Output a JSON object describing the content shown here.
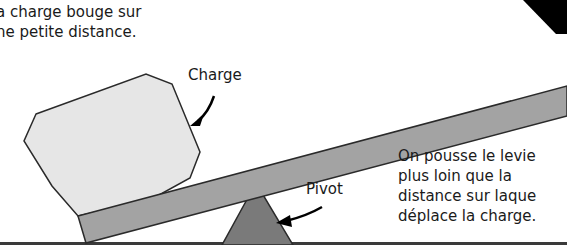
{
  "diagram": {
    "captions": {
      "load_motion": [
        "a charge bouge sur",
        "ne petite distance."
      ],
      "effort_motion": [
        "On pousse le levie",
        "plus loin que la",
        "distance sur laque",
        "déplace la charge."
      ]
    },
    "labels": {
      "load": "Charge",
      "pivot": "Pivot"
    },
    "colors": {
      "background": "#ffffff",
      "lever_fill": "#a3a3a3",
      "load_fill": "#e6e6e6",
      "pivot_fill": "#7a7a7a",
      "outline": "#2a2a2a",
      "effort_arrow": "#000000",
      "text": "#1a1a1a"
    }
  }
}
